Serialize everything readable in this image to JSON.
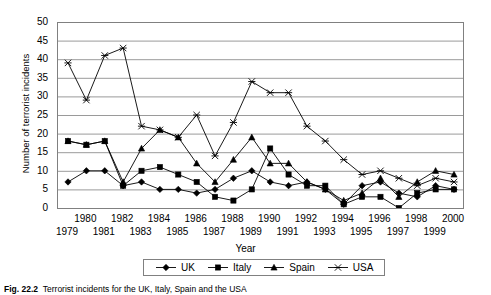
{
  "chart_data": {
    "type": "line",
    "title": "",
    "xlabel": "Year",
    "ylabel": "Number of terrorist incidents",
    "ylim": [
      0,
      50
    ],
    "ytick_step": 5,
    "yticks": [
      50,
      45,
      40,
      35,
      30,
      25,
      20,
      15,
      10,
      5,
      0
    ],
    "grid": "horizontal",
    "legend_position": "bottom",
    "x": [
      1979,
      1980,
      1981,
      1982,
      1983,
      1984,
      1985,
      1986,
      1987,
      1988,
      1989,
      1990,
      1991,
      1992,
      1993,
      1994,
      1995,
      1996,
      1997,
      1998,
      1999,
      2000
    ],
    "categories": [
      "1979",
      "1980",
      "1981",
      "1982",
      "1983",
      "1984",
      "1985",
      "1986",
      "1987",
      "1988",
      "1989",
      "1990",
      "1991",
      "1992",
      "1993",
      "1994",
      "1995",
      "1996",
      "1997",
      "1998",
      "1999",
      "2000"
    ],
    "series": [
      {
        "name": "UK",
        "marker": "diamond",
        "values": [
          7,
          10,
          10,
          6,
          7,
          5,
          5,
          4,
          5,
          8,
          10,
          7,
          6,
          7,
          5,
          1,
          6,
          7,
          4,
          3,
          6,
          5
        ]
      },
      {
        "name": "Italy",
        "marker": "square",
        "values": [
          18,
          17,
          18,
          6,
          10,
          11,
          9,
          7,
          3,
          2,
          5,
          16,
          9,
          6,
          6,
          1,
          3,
          3,
          0,
          4,
          5,
          5
        ]
      },
      {
        "name": "Spain",
        "marker": "triangle",
        "values": [
          18,
          17,
          18,
          7,
          16,
          21,
          19,
          12,
          7,
          13,
          19,
          12,
          12,
          7,
          5,
          2,
          4,
          8,
          3,
          7,
          10,
          9
        ]
      },
      {
        "name": "USA",
        "marker": "cross",
        "values": [
          39,
          29,
          41,
          43,
          22,
          21,
          19,
          25,
          14,
          23,
          34,
          31,
          31,
          22,
          18,
          13,
          9,
          10,
          8,
          6,
          8,
          7
        ]
      }
    ]
  },
  "caption": {
    "number": "Fig. 22.2",
    "text": "Terrorist incidents for the UK, Italy, Spain and the USA"
  },
  "legend": {
    "items": [
      {
        "label": "UK",
        "marker": "diamond"
      },
      {
        "label": "Italy",
        "marker": "square"
      },
      {
        "label": "Spain",
        "marker": "triangle"
      },
      {
        "label": "USA",
        "marker": "cross"
      }
    ]
  },
  "colors": {
    "series": "#000000",
    "grid": "#9a9a9a",
    "axis": "#808080",
    "background": "#ffffff"
  }
}
